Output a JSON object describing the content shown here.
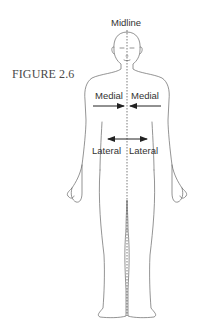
{
  "figure": {
    "caption": "FIGURE 2.6",
    "labels": {
      "midline": "Midline",
      "medial_left": "Medial",
      "medial_right": "Medial",
      "lateral_left": "Lateral",
      "lateral_right": "Lateral"
    },
    "colors": {
      "outline": "#555555",
      "text": "#333333",
      "arrows": "#222222"
    }
  }
}
